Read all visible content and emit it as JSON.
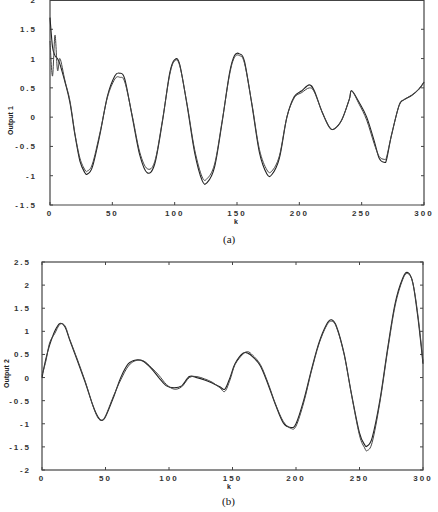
{
  "chart_data": [
    {
      "type": "line",
      "title": "",
      "caption": "(a)",
      "xlabel": "k",
      "ylabel": "Output 1",
      "xlim": [
        0,
        300
      ],
      "ylim": [
        -1.5,
        2
      ],
      "xticks": [
        "0",
        "50",
        "100",
        "150",
        "200",
        "250",
        "300"
      ],
      "yticks": [
        "-1.5",
        "-1",
        "-0.5",
        "0",
        "0.5",
        "1",
        "1.5",
        "2"
      ],
      "grid": false,
      "legend": null,
      "series": [
        {
          "name": "plant output",
          "x": [
            0,
            2,
            4,
            6,
            8,
            12,
            16,
            20,
            24,
            28,
            30,
            34,
            40,
            46,
            52,
            56,
            60,
            66,
            72,
            78,
            84,
            90,
            96,
            100,
            104,
            110,
            116,
            122,
            126,
            132,
            138,
            144,
            148,
            152,
            156,
            162,
            168,
            174,
            178,
            184,
            190,
            196,
            202,
            208,
            212,
            218,
            224,
            228,
            234,
            240,
            242,
            248,
            254,
            260,
            264,
            268,
            270,
            274,
            280,
            284,
            290,
            296,
            300
          ],
          "y": [
            1.7,
            1.2,
            1.05,
            1.0,
            0.9,
            0.6,
            0.25,
            -0.3,
            -0.75,
            -0.95,
            -0.97,
            -0.85,
            -0.3,
            0.35,
            0.7,
            0.75,
            0.65,
            0.0,
            -0.65,
            -0.95,
            -0.8,
            -0.1,
            0.75,
            0.98,
            0.9,
            0.2,
            -0.6,
            -1.08,
            -1.12,
            -0.85,
            -0.1,
            0.75,
            1.05,
            1.08,
            0.95,
            0.2,
            -0.6,
            -0.97,
            -0.98,
            -0.7,
            0.0,
            0.35,
            0.45,
            0.55,
            0.45,
            0.1,
            -0.17,
            -0.2,
            -0.05,
            0.3,
            0.45,
            0.25,
            0.0,
            -0.4,
            -0.7,
            -0.77,
            -0.72,
            -0.3,
            0.2,
            0.3,
            0.37,
            0.48,
            0.6
          ]
        },
        {
          "name": "model output",
          "x": [
            0,
            2,
            4,
            6,
            8,
            12,
            16,
            20,
            24,
            28,
            30,
            34,
            40,
            46,
            52,
            56,
            60,
            66,
            72,
            78,
            84,
            90,
            96,
            100,
            104,
            110,
            116,
            122,
            126,
            132,
            138,
            144,
            148,
            152,
            156,
            162,
            168,
            174,
            178,
            184,
            190,
            196,
            202,
            208,
            212,
            218,
            224,
            228,
            234,
            240,
            242,
            248,
            254,
            260,
            264,
            268,
            270,
            274,
            280,
            284,
            290,
            296,
            300
          ],
          "y": [
            1.3,
            0.7,
            1.4,
            0.8,
            1.0,
            0.62,
            0.28,
            -0.28,
            -0.7,
            -0.9,
            -0.92,
            -0.8,
            -0.27,
            0.33,
            0.65,
            0.68,
            0.6,
            0.02,
            -0.6,
            -0.88,
            -0.76,
            -0.08,
            0.72,
            0.96,
            0.88,
            0.22,
            -0.55,
            -1.02,
            -1.05,
            -0.8,
            -0.08,
            0.72,
            1.02,
            1.05,
            0.92,
            0.22,
            -0.55,
            -0.9,
            -0.92,
            -0.66,
            0.0,
            0.33,
            0.42,
            0.5,
            0.43,
            0.1,
            -0.17,
            -0.2,
            -0.05,
            0.3,
            0.45,
            0.22,
            -0.05,
            -0.45,
            -0.67,
            -0.72,
            -0.68,
            -0.3,
            0.2,
            0.3,
            0.37,
            0.48,
            0.6
          ]
        }
      ]
    },
    {
      "type": "line",
      "title": "",
      "caption": "(b)",
      "xlabel": "k",
      "ylabel": "Output 2",
      "xlim": [
        0,
        300
      ],
      "ylim": [
        -2,
        2.5
      ],
      "xticks": [
        "0",
        "50",
        "100",
        "150",
        "200",
        "250",
        "300"
      ],
      "yticks": [
        "-2",
        "-1.5",
        "-1",
        "-0.5",
        "0",
        "0.5",
        "1",
        "1.5",
        "2",
        "2.5"
      ],
      "grid": false,
      "legend": null,
      "series": [
        {
          "name": "plant output",
          "x": [
            0,
            3,
            6,
            10,
            14,
            18,
            22,
            28,
            34,
            40,
            44,
            47,
            50,
            56,
            62,
            68,
            74,
            80,
            86,
            92,
            98,
            104,
            110,
            116,
            122,
            128,
            134,
            140,
            144,
            148,
            152,
            158,
            162,
            166,
            172,
            178,
            184,
            190,
            196,
            200,
            206,
            212,
            218,
            224,
            228,
            232,
            238,
            244,
            250,
            254,
            256,
            260,
            266,
            272,
            278,
            284,
            288,
            292,
            296,
            300
          ],
          "y": [
            0.0,
            0.4,
            0.7,
            1.0,
            1.17,
            1.1,
            0.8,
            0.35,
            -0.1,
            -0.6,
            -0.85,
            -0.93,
            -0.85,
            -0.45,
            0.0,
            0.3,
            0.38,
            0.35,
            0.2,
            0.0,
            -0.18,
            -0.22,
            -0.18,
            0.02,
            0.0,
            -0.05,
            -0.12,
            -0.2,
            -0.25,
            0.0,
            0.3,
            0.52,
            0.53,
            0.45,
            0.25,
            -0.15,
            -0.6,
            -0.98,
            -1.08,
            -1.0,
            -0.5,
            0.15,
            0.75,
            1.15,
            1.25,
            1.1,
            0.5,
            -0.4,
            -1.2,
            -1.45,
            -1.48,
            -1.3,
            -0.5,
            0.6,
            1.6,
            2.15,
            2.27,
            2.05,
            1.3,
            0.3
          ]
        },
        {
          "name": "model output",
          "x": [
            0,
            3,
            6,
            10,
            14,
            18,
            22,
            28,
            34,
            40,
            44,
            47,
            50,
            56,
            62,
            68,
            74,
            80,
            86,
            92,
            98,
            104,
            110,
            116,
            122,
            128,
            134,
            140,
            144,
            148,
            152,
            158,
            162,
            166,
            172,
            178,
            184,
            190,
            196,
            200,
            206,
            212,
            218,
            224,
            228,
            232,
            238,
            244,
            250,
            254,
            256,
            260,
            266,
            272,
            278,
            284,
            288,
            292,
            296,
            300
          ],
          "y": [
            0.05,
            0.35,
            0.75,
            0.95,
            1.15,
            1.12,
            0.82,
            0.38,
            -0.08,
            -0.6,
            -0.87,
            -0.92,
            -0.83,
            -0.42,
            -0.05,
            0.25,
            0.37,
            0.36,
            0.22,
            0.05,
            -0.15,
            -0.25,
            -0.2,
            0.0,
            0.02,
            -0.03,
            -0.1,
            -0.22,
            -0.3,
            -0.05,
            0.28,
            0.5,
            0.56,
            0.48,
            0.28,
            -0.12,
            -0.58,
            -0.95,
            -1.1,
            -1.05,
            -0.55,
            0.12,
            0.72,
            1.12,
            1.22,
            1.08,
            0.48,
            -0.42,
            -1.25,
            -1.52,
            -1.58,
            -1.4,
            -0.55,
            0.55,
            1.55,
            2.12,
            2.25,
            2.05,
            1.35,
            0.35
          ]
        }
      ]
    }
  ],
  "charts": {
    "top": {
      "ylabel": "Output 1",
      "xlabel": "k",
      "caption": "(a)"
    },
    "bottom": {
      "ylabel": "Output 2",
      "xlabel": "k",
      "caption": "(b)"
    }
  }
}
